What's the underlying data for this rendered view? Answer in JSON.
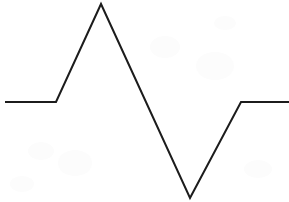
{
  "figure": {
    "title": "",
    "background_color": "#ffffff",
    "stroke_color": "#1c1c1c",
    "stroke_width": 2,
    "width": 289,
    "height": 202,
    "caption": ""
  },
  "chart_data": {
    "type": "line",
    "title": "",
    "subtitle": "",
    "xlabel": "",
    "ylabel": "",
    "xlim": [
      0,
      289
    ],
    "ylim": [
      0,
      202
    ],
    "grid": false,
    "legend": false,
    "axes_visible": false,
    "tick_labels_x": [],
    "tick_labels_y": [],
    "annotations": [],
    "series": [
      {
        "name": "waveform",
        "color": "#1c1c1c",
        "line_width": 2,
        "marker": "none",
        "points": [
          {
            "label": "left-baseline-start",
            "x": 5,
            "y": 102
          },
          {
            "label": "peak-rise-start",
            "x": 56,
            "y": 102
          },
          {
            "label": "peak-apex",
            "x": 101,
            "y": 4
          },
          {
            "label": "trough-bottom",
            "x": 190,
            "y": 198
          },
          {
            "label": "right-baseline-start",
            "x": 241,
            "y": 102
          },
          {
            "label": "right-baseline-end",
            "x": 289,
            "y": 102
          }
        ],
        "path": "M 5,102 L 56,102 L 101,4 L 190,198 L 241,102 L 289,102"
      }
    ]
  },
  "accessibility": {
    "alt_text": "Line drawing of a waveform with a flat baseline, a tall narrow peak, a deep sharp trough, and a return to the flat baseline."
  }
}
